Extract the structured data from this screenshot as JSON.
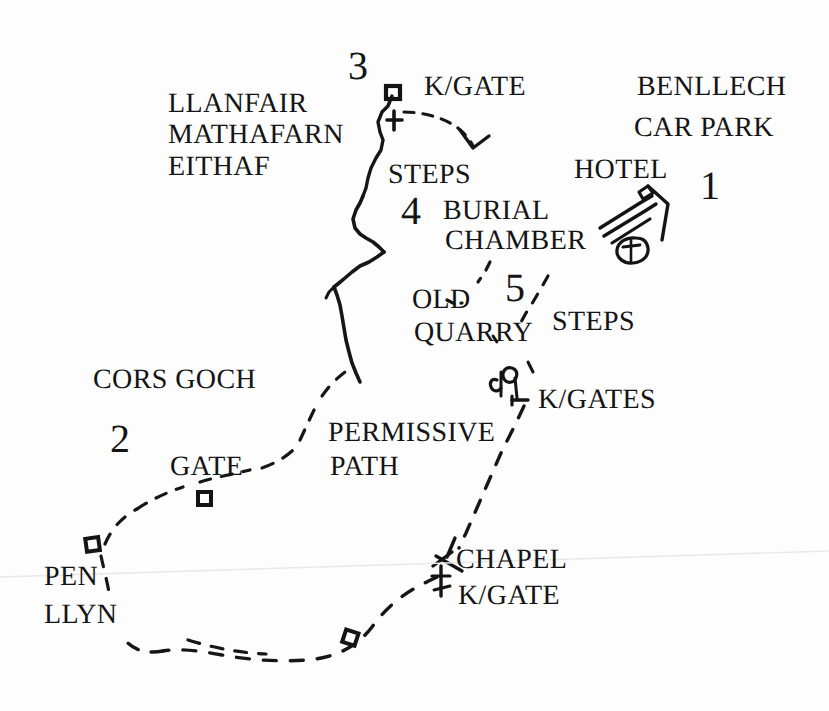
{
  "map": {
    "title": "Benllech circular walk route map",
    "style": "hand-drawn line map, black ink on white paper",
    "background_color": "#fdfdfd",
    "ink_color": "#141414",
    "width": 829,
    "height": 711
  },
  "labels": {
    "llanfair": "LLANFAIR",
    "mathafarn": "MATHAFARN",
    "eithaf": "EITHAF",
    "kgate_top": "K/GATE",
    "benllech": "BENLLECH",
    "car_park": "CAR PARK",
    "hotel": "HOTEL",
    "steps_upper": "STEPS",
    "burial": "BURIAL",
    "chamber": "CHAMBER",
    "old": "OLD",
    "quarry": "QUARRY",
    "steps_lower": "STEPS",
    "kgates": "K/GATES",
    "cors_goch": "CORS GOCH",
    "gate": "GATE",
    "permissive": "PERMISSIVE",
    "path": "PATH",
    "pen": "PEN",
    "llyn": "LLYN",
    "chapel": "CHAPEL",
    "kgate_chapel": "K/GATE"
  },
  "waypoint_numbers": {
    "one": "1",
    "two": "2",
    "three": "3",
    "four": "4",
    "five": "5"
  },
  "symbols": {
    "gate_square_top": "gate-square-symbol",
    "church_cross": "church-cross-symbol",
    "hotel_buildings": "hotel-buildings-symbol",
    "kissing_gates_pair": "kissing-gates-symbol",
    "gate_square_mid": "gate-square-symbol",
    "gate_square_pen": "gate-square-symbol",
    "gate_square_bottom": "gate-square-symbol",
    "chapel_marker": "chapel-symbol",
    "arrow_chevron": "direction-arrow"
  },
  "paths": {
    "solid_footpath": "solid hand-drawn footpath running north-south through centre",
    "dashed_permissive_path": "long dashed permissive path looping south and west",
    "dashed_top_arc": "short dashed arc near K/GATE at top",
    "dashed_quarry_path": "dashed path descending past OLD QUARRY and number 5"
  }
}
